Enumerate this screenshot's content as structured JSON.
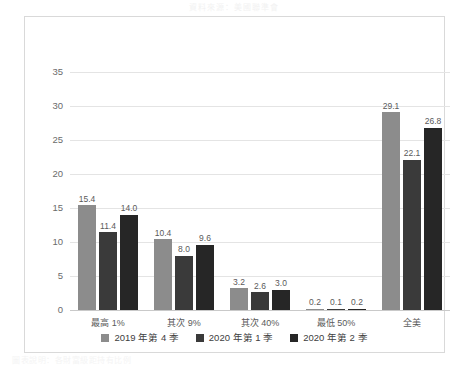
{
  "ghost_caption_top": "資料來源：美國聯準會",
  "ghost_caption_bottom": "圖表說明：各財富級距持有比例",
  "chart_data": {
    "type": "bar",
    "title": "",
    "xlabel": "",
    "ylabel": "",
    "ylim": [
      0,
      35
    ],
    "yticks": [
      0,
      5,
      10,
      15,
      20,
      25,
      30,
      35
    ],
    "ytick_labels": [
      "0",
      "5",
      "10",
      "15",
      "20",
      "25",
      "30",
      "35"
    ],
    "grid": true,
    "legend_position": "bottom",
    "categories": [
      "最高 1%",
      "其次 9%",
      "其次 40%",
      "最低 50%",
      "全美"
    ],
    "series": [
      {
        "name": "2019 年第 4 季",
        "color": "#8c8c8c",
        "values": [
          15.4,
          10.4,
          3.2,
          0.2,
          29.1
        ],
        "labels": [
          "15.4",
          "10.4",
          "3.2",
          "0.2",
          "29.1"
        ]
      },
      {
        "name": "2020 年第 1 季",
        "color": "#3a3a3a",
        "values": [
          11.4,
          8.0,
          2.6,
          0.1,
          22.1
        ],
        "labels": [
          "11.4",
          "8.0",
          "2.6",
          "0.1",
          "22.1"
        ]
      },
      {
        "name": "2020 年第 2 季",
        "color": "#262626",
        "values": [
          14.0,
          9.6,
          3.0,
          0.2,
          26.8
        ],
        "labels": [
          "14.0",
          "9.6",
          "3.0",
          "0.2",
          "26.8"
        ]
      }
    ]
  }
}
